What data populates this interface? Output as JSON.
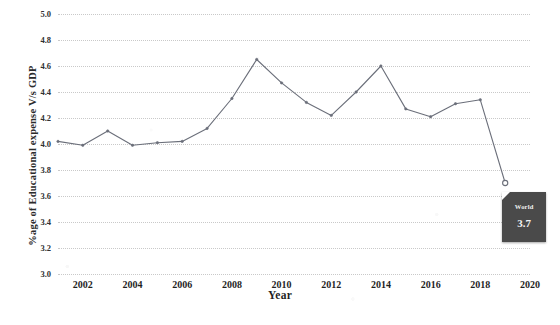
{
  "chart_data": {
    "type": "line",
    "title": "",
    "xlabel": "Year",
    "ylabel": "%age of Educational expense V/s GDP",
    "xlim": [
      2001,
      2020
    ],
    "ylim": [
      3.0,
      5.0
    ],
    "grid": true,
    "legend": null,
    "x": [
      2001,
      2002,
      2003,
      2004,
      2005,
      2006,
      2007,
      2008,
      2009,
      2010,
      2011,
      2012,
      2013,
      2014,
      2015,
      2016,
      2017,
      2018,
      2019
    ],
    "xtick_labels": [
      "2002",
      "2004",
      "2006",
      "2008",
      "2010",
      "2012",
      "2014",
      "2016",
      "2018",
      "2020"
    ],
    "xticks": [
      2002,
      2004,
      2006,
      2008,
      2010,
      2012,
      2014,
      2016,
      2018,
      2020
    ],
    "ytick_labels": [
      "3.0",
      "3.2",
      "3.4",
      "3.6",
      "3.8",
      "4.0",
      "4.2",
      "4.4",
      "4.6",
      "4.8",
      "5.0"
    ],
    "yticks": [
      3.0,
      3.2,
      3.4,
      3.6,
      3.8,
      4.0,
      4.2,
      4.4,
      4.6,
      4.8,
      5.0
    ],
    "series": [
      {
        "name": "World",
        "color": "#6b6f7a",
        "values": [
          4.02,
          3.99,
          4.1,
          3.99,
          4.01,
          4.02,
          4.12,
          4.35,
          4.65,
          4.47,
          4.32,
          4.22,
          4.4,
          4.6,
          4.27,
          4.21,
          4.31,
          4.34,
          3.7
        ]
      }
    ],
    "annotation": {
      "label": "World",
      "value": "3.7",
      "at_x": 2019,
      "at_y": 3.7
    }
  },
  "axes": {
    "y_title": "%age of Educational expense V/s GDP",
    "x_title": "Year"
  },
  "watermarks": {
    "left": "",
    "right": ""
  }
}
